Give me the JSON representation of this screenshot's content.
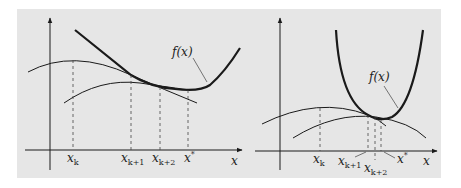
{
  "figure": {
    "background": "#e6e6e6",
    "ink": "#1a1a1a",
    "panels": [
      {
        "id": "left",
        "curve_label": "f(x)",
        "axis_label": "x",
        "ticks": [
          {
            "base": "x",
            "sub": "k"
          },
          {
            "base": "x",
            "sub": "k+1"
          },
          {
            "base": "x",
            "sub": "k+2"
          },
          {
            "base": "x",
            "sup": "*"
          }
        ]
      },
      {
        "id": "right",
        "curve_label": "f(x)",
        "axis_label": "x",
        "ticks": [
          {
            "base": "x",
            "sub": "k"
          },
          {
            "base": "x",
            "sub": "k+1"
          },
          {
            "base": "x",
            "sub": "k+2"
          },
          {
            "base": "x",
            "sup": "*"
          }
        ]
      }
    ]
  }
}
